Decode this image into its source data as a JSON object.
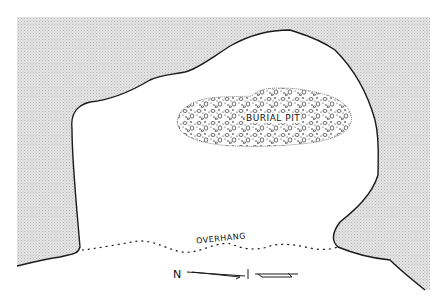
{
  "diagram": {
    "type": "rockshelter plan",
    "labels": {
      "burial_pit": "BURIAL PIT",
      "overhang": "OVERHANG",
      "north": "N"
    },
    "colors": {
      "rock_fill": "#d8d8d8",
      "outline": "#1a1a1a",
      "background": "#ffffff"
    }
  }
}
